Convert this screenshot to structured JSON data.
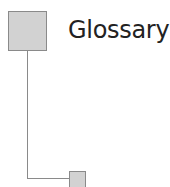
{
  "diagram": {
    "title": "Glossary",
    "nodes": [
      {
        "id": "root",
        "shape": "square",
        "size": "large"
      },
      {
        "id": "child",
        "shape": "square",
        "size": "small"
      }
    ],
    "connectors": [
      {
        "from": "root",
        "to": "child",
        "style": "elbow"
      }
    ],
    "colors": {
      "node_fill": "#d2d2d2",
      "node_border": "#8a8a8a",
      "connector": "#8a8a8a",
      "text": "#222222"
    }
  }
}
